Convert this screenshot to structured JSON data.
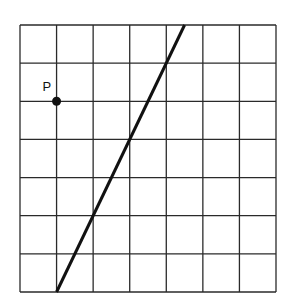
{
  "diagram": {
    "grid": {
      "cols": 7,
      "rows": 7,
      "left": 20,
      "top": 25,
      "right": 276,
      "bottom": 292,
      "color": "#2a2a2a"
    },
    "line": {
      "from": [
        1,
        7
      ],
      "to": [
        4.5,
        0
      ],
      "color": "#111111"
    },
    "point": {
      "label": "P",
      "at": [
        1,
        2
      ],
      "color": "#111111"
    }
  }
}
